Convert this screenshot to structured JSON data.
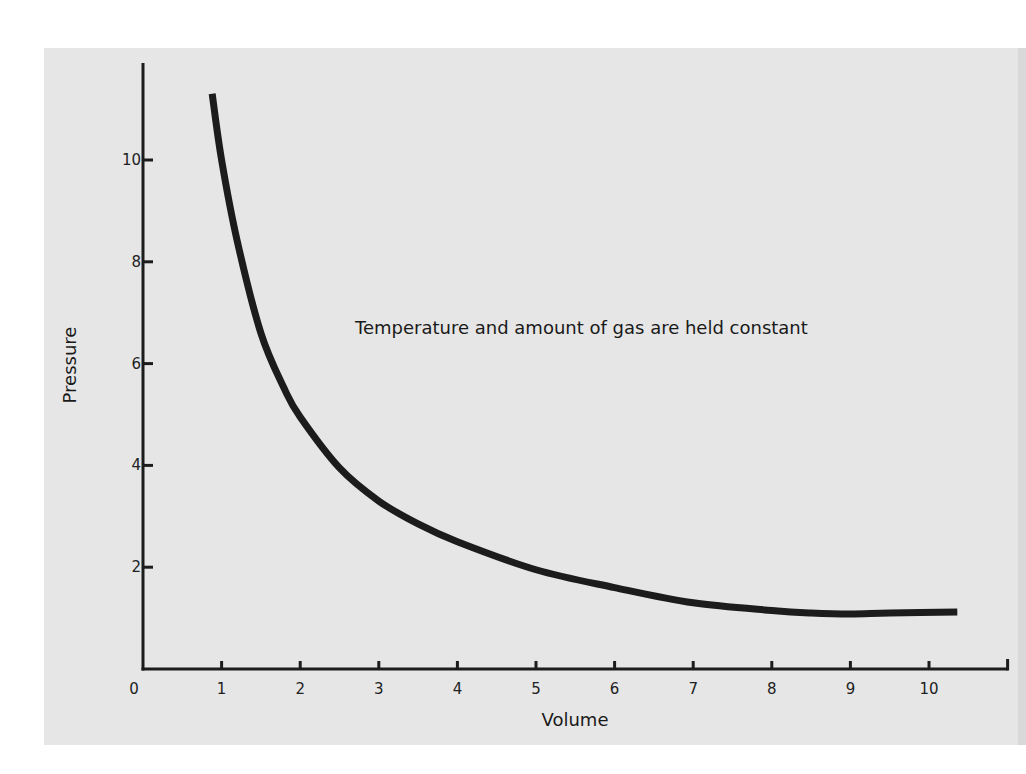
{
  "chart_data": {
    "type": "line",
    "title": "",
    "xlabel": "Volume",
    "ylabel": "Pressure",
    "annotation": "Temperature and amount of gas are held constant",
    "xlim": [
      0,
      11
    ],
    "ylim": [
      0,
      11.5
    ],
    "x_ticks": [
      0,
      1,
      2,
      3,
      4,
      5,
      6,
      7,
      8,
      9,
      10
    ],
    "x_tick_labels": [
      "0",
      "1",
      "2",
      "3",
      "4",
      "5",
      "6",
      "7",
      "8",
      "9",
      "10"
    ],
    "y_ticks": [
      2,
      4,
      6,
      8,
      10
    ],
    "y_tick_labels": [
      "2",
      "4",
      "6",
      "8",
      "10"
    ],
    "grid": false,
    "legend": null,
    "series": [
      {
        "name": "Pressure vs Volume",
        "color": "#1c1c1c",
        "x": [
          0.88,
          1.0,
          1.2,
          1.5,
          1.8,
          2.0,
          2.5,
          3.0,
          3.5,
          4.0,
          5.0,
          6.0,
          7.0,
          8.0,
          8.5,
          9.0,
          9.5,
          10.36
        ],
        "y": [
          11.3,
          10.0,
          8.4,
          6.6,
          5.5,
          4.95,
          3.95,
          3.3,
          2.85,
          2.5,
          1.95,
          1.6,
          1.3,
          1.15,
          1.1,
          1.08,
          1.1,
          1.12
        ]
      }
    ]
  },
  "colors": {
    "panel_background": "#e6e6e6",
    "page_background": "#ffffff",
    "ink": "#1c1c1c"
  }
}
